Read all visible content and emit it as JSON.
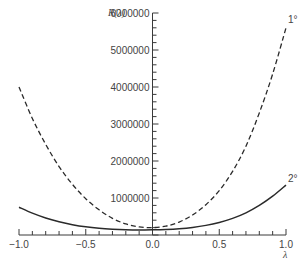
{
  "chart_data": {
    "type": "line",
    "title": "",
    "xlabel": "λ",
    "ylabel": "R(λ)",
    "xlim": [
      -1.0,
      1.0
    ],
    "ylim": [
      0,
      6000000
    ],
    "grid": false,
    "legend": "inline labels at right end of curves",
    "x_ticks": [
      "-1.0",
      "-0.5",
      "0.0",
      "0.5",
      "1.0"
    ],
    "y_ticks": [
      "1000000",
      "2000000",
      "3000000",
      "4000000",
      "5000000",
      "6000000"
    ],
    "x": [
      -1.0,
      -0.9,
      -0.8,
      -0.7,
      -0.6,
      -0.5,
      -0.4,
      -0.3,
      -0.2,
      -0.1,
      0.0,
      0.1,
      0.2,
      0.3,
      0.4,
      0.5,
      0.6,
      0.7,
      0.8,
      0.9,
      1.0
    ],
    "series": [
      {
        "name": "1°",
        "style": "dashed",
        "values": [
          4000000,
          3150000,
          2450000,
          1850000,
          1370000,
          980000,
          680000,
          450000,
          300000,
          220000,
          200000,
          240000,
          350000,
          540000,
          820000,
          1200000,
          1720000,
          2400000,
          3300000,
          4350000,
          5600000
        ]
      },
      {
        "name": "2°",
        "style": "solid",
        "values": [
          750000,
          590000,
          460000,
          360000,
          280000,
          220000,
          180000,
          155000,
          140000,
          135000,
          140000,
          150000,
          170000,
          205000,
          260000,
          340000,
          450000,
          600000,
          800000,
          1050000,
          1350000
        ]
      }
    ]
  }
}
